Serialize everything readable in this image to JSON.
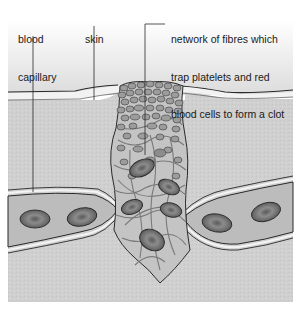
{
  "diagram": {
    "topic": "blood clot formation in a skin wound",
    "labels": [
      {
        "id": "blood-capillary",
        "lines": [
          "blood",
          "capillary"
        ]
      },
      {
        "id": "skin",
        "lines": [
          "skin"
        ]
      },
      {
        "id": "clot-network",
        "lines": [
          "network of fibres which",
          "trap platelets and red",
          "blood cells to form a clot"
        ]
      }
    ],
    "colors": {
      "tissue": "#cfcfcf",
      "skin_surface": "#e4e4e4",
      "capillary_fill": "#bdbdbd",
      "red_cell": "#6e6e6e",
      "red_cell_center": "#8a8a8a",
      "fibre": "#7a7a7a",
      "clot_fill": "#b9b9b9",
      "platelet": "#9a9a9a",
      "outline": "#2a2a2a"
    }
  }
}
